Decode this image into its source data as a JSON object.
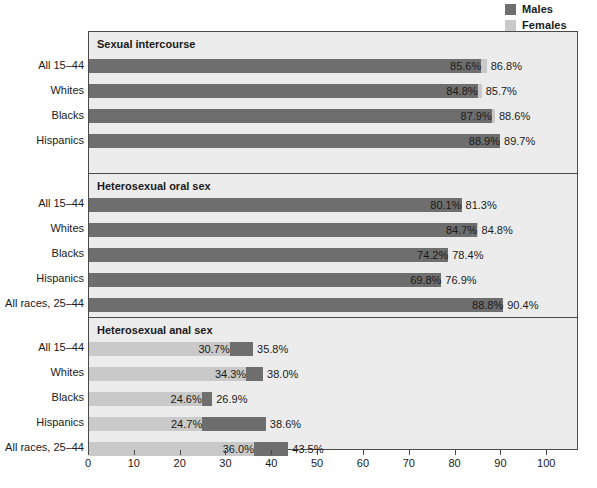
{
  "legend": {
    "position": "top-right",
    "items": [
      {
        "label": "Males",
        "color": "#6e6e6e",
        "icon": "legend-swatch-icon"
      },
      {
        "label": "Females",
        "color": "#c9c9c9",
        "icon": "legend-swatch-icon"
      }
    ]
  },
  "axis": {
    "ticks": [
      0,
      10,
      20,
      30,
      40,
      50,
      60,
      70,
      80,
      90,
      100
    ],
    "xmin": 0,
    "xmax": 106.5,
    "xlabel": "",
    "ylabel": ""
  },
  "colors": {
    "males": "#6e6e6e",
    "females": "#c9c9c9",
    "panel_background": "#ececec",
    "frame": "#4a4a4a",
    "page_background": "#ffffff",
    "text": "#1a1a1a"
  },
  "chart_data": {
    "type": "bar",
    "orientation": "horizontal",
    "title": "",
    "xlabel": "",
    "ylabel": "",
    "xlim": [
      0,
      106.5
    ],
    "grid": false,
    "legend_position": "top-right",
    "series_names": [
      "Males",
      "Females"
    ],
    "panels": [
      {
        "title": "Sexual intercourse",
        "categories": [
          "All 15–44",
          "Whites",
          "Blacks",
          "Hispanics"
        ],
        "rows": [
          {
            "category": "All 15–44",
            "males": 85.6,
            "females": 86.8,
            "males_label": "85.6%",
            "females_label": "86.8%"
          },
          {
            "category": "Whites",
            "males": 84.8,
            "females": 85.7,
            "males_label": "84.8%",
            "females_label": "85.7%"
          },
          {
            "category": "Blacks",
            "males": 87.9,
            "females": 88.6,
            "males_label": "87.9%",
            "females_label": "88.6%"
          },
          {
            "category": "Hispanics",
            "males": 89.7,
            "females": 88.9,
            "males_label": "88.9%",
            "females_label": "89.7%"
          }
        ]
      },
      {
        "title": "Heterosexual oral sex",
        "categories": [
          "All 15–44",
          "Whites",
          "Blacks",
          "Hispanics",
          "All races, 25–44"
        ],
        "rows": [
          {
            "category": "All 15–44",
            "males": 81.3,
            "females": 80.1,
            "males_label": "80.1%",
            "females_label": "81.3%"
          },
          {
            "category": "Whites",
            "males": 84.7,
            "females": 84.8,
            "males_label": "84.7%",
            "females_label": "84.8%"
          },
          {
            "category": "Blacks",
            "males": 78.4,
            "females": 74.2,
            "males_label": "74.2%",
            "females_label": "78.4%"
          },
          {
            "category": "Hispanics",
            "males": 76.9,
            "females": 69.8,
            "males_label": "69.8%",
            "females_label": "76.9%"
          },
          {
            "category": "All races, 25–44",
            "males": 90.4,
            "females": 88.8,
            "males_label": "88.8%",
            "females_label": "90.4%"
          }
        ]
      },
      {
        "title": "Heterosexual anal sex",
        "categories": [
          "All 15–44",
          "Whites",
          "Blacks",
          "Hispanics",
          "All races, 25–44"
        ],
        "rows": [
          {
            "category": "All 15–44",
            "males": 35.8,
            "females": 30.7,
            "males_label": "35.8%",
            "females_label": "30.7%"
          },
          {
            "category": "Whites",
            "males": 38.0,
            "females": 34.3,
            "males_label": "38.0%",
            "females_label": "34.3%"
          },
          {
            "category": "Blacks",
            "males": 26.9,
            "females": 24.6,
            "males_label": "26.9%",
            "females_label": "24.6%"
          },
          {
            "category": "Hispanics",
            "males": 38.6,
            "females": 24.7,
            "males_label": "38.6%",
            "females_label": "24.7%"
          },
          {
            "category": "All races, 25–44",
            "males": 43.5,
            "females": 36.0,
            "males_label": "43.5%",
            "females_label": "36.0%"
          }
        ]
      }
    ]
  }
}
